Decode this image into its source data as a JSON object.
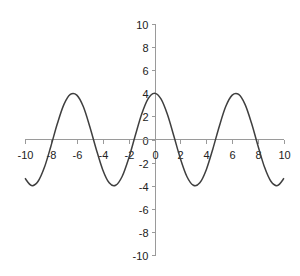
{
  "chart_data": {
    "type": "line",
    "title": "",
    "xlabel": "",
    "ylabel": "",
    "function_hint": "y = 4cos(x)",
    "xlim": [
      -10,
      10
    ],
    "ylim": [
      -10,
      10
    ],
    "grid": false,
    "legend": null,
    "x_ticks": [
      -10,
      -8,
      -6,
      -4,
      -2,
      0,
      2,
      4,
      6,
      8,
      10
    ],
    "y_ticks": [
      10,
      8,
      6,
      4,
      2,
      0,
      -2,
      -4,
      -6,
      -8,
      -10
    ],
    "x_tick_labels": [
      "-10",
      "-8",
      "-6",
      "-4",
      "-2",
      "0",
      "2",
      "4",
      "6",
      "8",
      "10"
    ],
    "y_tick_labels": [
      "10",
      "8",
      "6",
      "4",
      "2",
      "0",
      "-2",
      "-4",
      "-6",
      "-8",
      "-10"
    ],
    "series": [
      {
        "name": "y",
        "color": "#3f3f3f",
        "x": [
          -10,
          -9.5,
          -9,
          -8.5,
          -8,
          -7.5,
          -7,
          -6.5,
          -6,
          -5.5,
          -5,
          -4.5,
          -4,
          -3.5,
          -3,
          -2.5,
          -2,
          -1.5,
          -1,
          -0.5,
          0,
          0.5,
          1,
          1.5,
          2,
          2.5,
          3,
          3.5,
          4,
          4.5,
          5,
          5.5,
          6,
          6.5,
          7,
          7.5,
          8,
          8.5,
          9,
          9.5,
          10
        ],
        "values": [
          -3.36,
          -3.99,
          -3.64,
          -2.41,
          -0.58,
          1.38,
          3.02,
          3.9,
          3.84,
          2.85,
          1.13,
          -0.84,
          -2.61,
          -3.75,
          -3.96,
          -3.2,
          -1.66,
          0.28,
          2.16,
          3.51,
          4.0,
          3.51,
          2.16,
          0.28,
          -1.66,
          -3.2,
          -3.96,
          -3.75,
          -2.61,
          -0.84,
          1.13,
          2.85,
          3.84,
          3.9,
          3.02,
          1.38,
          -0.58,
          -2.41,
          -3.64,
          -3.99,
          -3.36
        ]
      }
    ]
  },
  "colors": {
    "axis": "#9a9a9a",
    "series": "#3f3f3f",
    "background": "#ffffff"
  }
}
